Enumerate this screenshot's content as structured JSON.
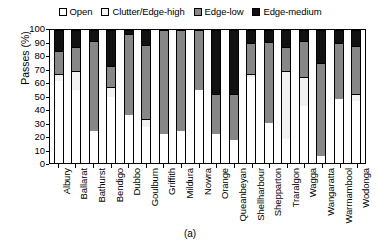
{
  "chart_data": {
    "type": "bar",
    "subtype": "stacked-bar-100",
    "title": "",
    "caption": "(a)",
    "xlabel": "",
    "ylabel": "Passes (%)",
    "ylim": [
      0,
      100
    ],
    "ytick_labels": [
      "0",
      "10",
      "20",
      "30",
      "40",
      "50",
      "60",
      "70",
      "80",
      "90",
      "100"
    ],
    "ytick_values": [
      0,
      10,
      20,
      30,
      40,
      50,
      60,
      70,
      80,
      90,
      100
    ],
    "grid": false,
    "legend_position": "top-center",
    "categories": [
      "Albury",
      "Ballarat",
      "Bathurst",
      "Bendigo",
      "Dubbo",
      "Goulburn",
      "Griffith",
      "Mildura",
      "Nowra",
      "Orange",
      "Queanbeyan",
      "Shellharbour",
      "Shepparton",
      "Traralgon",
      "Wagga",
      "Wangaratta",
      "Warrnambool",
      "Wodonga"
    ],
    "series": [
      {
        "name": "Open",
        "color": "#ffffff",
        "values": [
          62,
          55,
          24,
          50,
          36,
          27,
          22,
          24,
          55,
          22,
          17,
          64,
          30,
          18,
          43,
          5,
          48,
          47
        ]
      },
      {
        "name": "Clutter/Edge-high",
        "color": "#f2f2f2",
        "values": [
          5,
          14,
          0,
          7,
          0,
          6,
          0,
          0,
          0,
          0,
          0,
          3,
          0,
          51,
          22,
          0,
          0,
          5
        ]
      },
      {
        "name": "Edge-low",
        "color": "#878787",
        "values": [
          17,
          18,
          68,
          16,
          61,
          56,
          78,
          76,
          45,
          30,
          35,
          23,
          61,
          18,
          27,
          70,
          42,
          36
        ]
      },
      {
        "name": "Edge-medium",
        "color": "#111111",
        "values": [
          16,
          13,
          8,
          27,
          3,
          11,
          0,
          0,
          0,
          48,
          48,
          10,
          9,
          13,
          8,
          25,
          10,
          12
        ]
      }
    ]
  },
  "legend": {
    "items": [
      {
        "label": "Open",
        "color": "#ffffff"
      },
      {
        "label": "Clutter/Edge-high",
        "color": "#f2f2f2"
      },
      {
        "label": "Edge-low",
        "color": "#878787"
      },
      {
        "label": "Edge-medium",
        "color": "#111111"
      }
    ]
  }
}
